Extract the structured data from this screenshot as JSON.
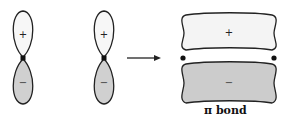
{
  "diagram": {
    "orbital_1": {
      "upper_sign": "+",
      "lower_sign": "−"
    },
    "orbital_2": {
      "upper_sign": "+",
      "lower_sign": "−"
    },
    "pi_bond": {
      "upper_sign": "+",
      "lower_sign": "−",
      "label": "π bond"
    },
    "colors": {
      "outline": "#222222",
      "positive_fill": "#f4f4f4",
      "negative_fill": "#cfcfcf"
    }
  }
}
